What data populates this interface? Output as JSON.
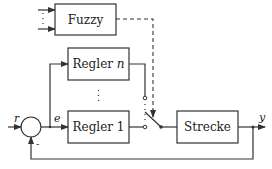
{
  "diagram": {
    "type": "block-diagram",
    "blocks": {
      "fuzzy": {
        "label": "Fuzzy"
      },
      "regler_n": {
        "label": "Regler ",
        "label_var": "n"
      },
      "regler_1": {
        "label": "Regler 1"
      },
      "strecke": {
        "label": "Strecke"
      }
    },
    "summing_junction": {
      "feedback_sign": "-"
    },
    "signals": {
      "reference": "r",
      "error": "e",
      "output": "y"
    },
    "ellipsis_vertical": "⋮",
    "colors": {
      "line": "#333333",
      "background": "#ffffff"
    }
  }
}
